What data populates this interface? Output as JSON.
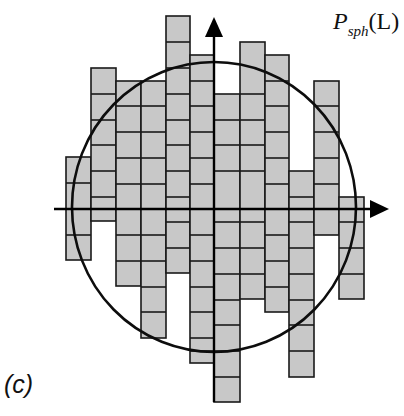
{
  "figure": {
    "panel_label": "(c)",
    "function_label": {
      "main": "P",
      "subscript": "sph",
      "argument": "(L)"
    }
  },
  "style": {
    "cell_fill": "#c8c8c8",
    "cell_stroke": "#1a1a1a",
    "axis_color": "#000000",
    "circle_color": "#0d0d0d"
  },
  "axes": {
    "origin": [
      214,
      209
    ],
    "x_axis": {
      "start": 54,
      "end": 389
    },
    "y_axis": {
      "start": 402,
      "end": 17
    }
  },
  "circle": {
    "cx": 214,
    "cy": 207,
    "rx": 142,
    "ry": 145
  },
  "columns": [
    {
      "x0": 66,
      "x1": 91,
      "top": 157,
      "bottom": 260,
      "lines": [
        183,
        235
      ]
    },
    {
      "x0": 91,
      "x1": 116,
      "top": 68,
      "bottom": 221,
      "lines": [
        94,
        120,
        145,
        171,
        197
      ]
    },
    {
      "x0": 116,
      "x1": 141,
      "top": 81,
      "bottom": 286,
      "lines": [
        106,
        132,
        158,
        184,
        235,
        261
      ]
    },
    {
      "x0": 141,
      "x1": 166,
      "top": 81,
      "bottom": 338,
      "lines": [
        106,
        132,
        158,
        184,
        235,
        261,
        287,
        312
      ]
    },
    {
      "x0": 166,
      "x1": 190,
      "top": 16,
      "bottom": 273,
      "lines": [
        42,
        68,
        94,
        120,
        145,
        171,
        197,
        222,
        248
      ]
    },
    {
      "x0": 190,
      "x1": 214,
      "top": 55,
      "bottom": 363,
      "lines": [
        81,
        106,
        132,
        158,
        184,
        235,
        261,
        287,
        312,
        338,
        351
      ]
    },
    {
      "x0": 214,
      "x1": 240,
      "top": 94,
      "bottom": 402,
      "lines": [
        120,
        145,
        171,
        222,
        248,
        274,
        300,
        325,
        351,
        377
      ]
    },
    {
      "x0": 240,
      "x1": 265,
      "top": 42,
      "bottom": 299,
      "lines": [
        94,
        120,
        145,
        171,
        222,
        248,
        274
      ]
    },
    {
      "x0": 265,
      "x1": 289,
      "top": 55,
      "bottom": 312,
      "lines": [
        81,
        106,
        132,
        158,
        184,
        235,
        261,
        287
      ]
    },
    {
      "x0": 289,
      "x1": 314,
      "top": 171,
      "bottom": 377,
      "lines": [
        197,
        222,
        248,
        274,
        300,
        325,
        351
      ]
    },
    {
      "x0": 314,
      "x1": 339,
      "top": 81,
      "bottom": 235,
      "lines": [
        106,
        132,
        158,
        184
      ]
    },
    {
      "x0": 339,
      "x1": 364,
      "top": 197,
      "bottom": 299,
      "lines": [
        222,
        248,
        274
      ]
    }
  ]
}
